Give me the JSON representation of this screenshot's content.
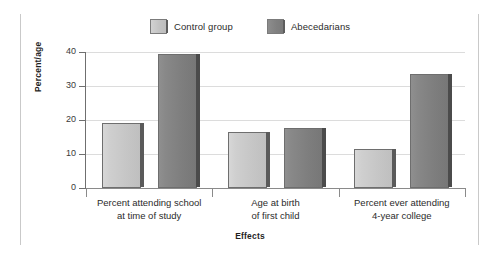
{
  "chart_data": {
    "type": "bar",
    "title": "",
    "xlabel": "Effects",
    "ylabel": "Percent/age",
    "categories": [
      "Percent attending school\nat time of study",
      "Age at birth\nof first child",
      "Percent ever attending\n4-year college"
    ],
    "series": [
      {
        "name": "Control group",
        "values": [
          19,
          16.5,
          11.5
        ],
        "color": "#c8c8c8"
      },
      {
        "name": "Abecedarians",
        "values": [
          39.5,
          17.7,
          33.5
        ],
        "color": "#828282"
      }
    ],
    "ylim": [
      0,
      40
    ],
    "yticks": [
      0,
      10,
      20,
      30,
      40
    ],
    "ytick_labels": [
      "0",
      "10",
      "20",
      "30",
      "40"
    ],
    "grid": true,
    "legend_position": "top-center"
  },
  "legend": {
    "items": [
      {
        "label": "Control group",
        "swatch": "light-gray-swatch"
      },
      {
        "label": "Abecedarians",
        "swatch": "dark-gray-swatch"
      }
    ]
  },
  "axes": {
    "y_title": "Percent/age",
    "x_title": "Effects",
    "y_tick_labels": [
      "40",
      "30",
      "20",
      "10",
      "0"
    ]
  }
}
